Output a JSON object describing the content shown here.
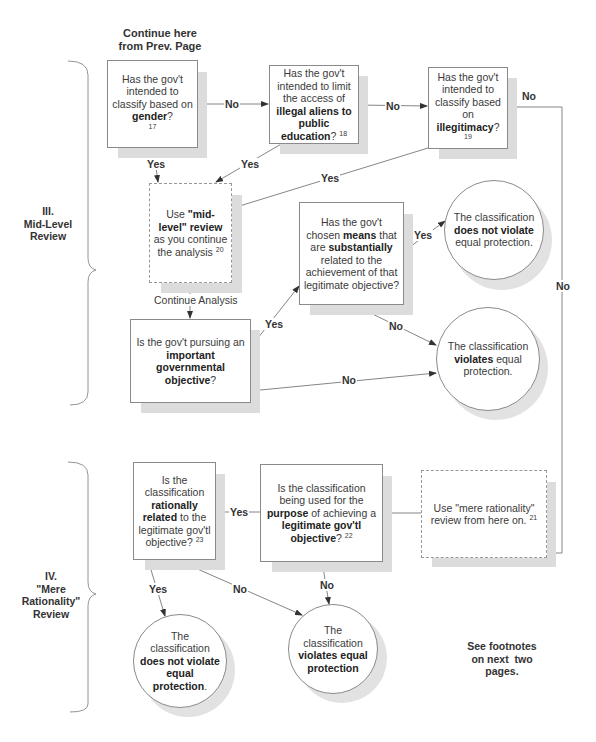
{
  "header": {
    "continue_line1": "Continue here",
    "continue_line2": "from Prev. Page"
  },
  "sections": {
    "mid_level": {
      "line1": "III.",
      "line2": "Mid-Level",
      "line3": "Review"
    },
    "mere_rationality": {
      "line1": "IV.",
      "line2": "\"Mere",
      "line3": "Rationality\"",
      "line4": "Review"
    }
  },
  "nodes": {
    "gender": {
      "pre": "Has the gov't intended to classify based on ",
      "bold": "gender",
      "post": "?",
      "footnote": "17"
    },
    "aliens": {
      "pre": "Has the gov't intended to limit the access of ",
      "bold": "illegal aliens to public education",
      "post": "?",
      "footnote": "18"
    },
    "illegitimacy": {
      "pre": "Has the gov't intended to classify based on ",
      "bold": "illegitimacy",
      "post": "?",
      "footnote": "19"
    },
    "mid_level_review": {
      "pre": "Use ",
      "bold1": "\"mid-level\" review",
      "post": " as you continue the analysis",
      "footnote": "20"
    },
    "important_objective": {
      "pre": "Is the gov't pursuing an ",
      "bold": "important governmental objective",
      "post": "?"
    },
    "substantially_related": {
      "pre": "Has the gov't chosen ",
      "bold1": "means",
      "mid": " that are ",
      "bold2": "substantially",
      "post": " related to the achievement of that legitimate objective?"
    },
    "mere_rationality_review": {
      "text": "Use \"mere rationality\" review from here on.",
      "footnote": "21"
    },
    "legitimate_purpose": {
      "pre": "Is the classification being used for the ",
      "bold1": "purpose",
      "mid": " of achieving a ",
      "bold2": "legitimate gov'tl objective",
      "post": "?",
      "footnote": "22"
    },
    "rationally_related": {
      "pre": "Is the classification ",
      "bold": "rationally related",
      "post": " to the legitimate gov'tl objective?",
      "footnote": "23"
    }
  },
  "outcomes": {
    "mid_not_violate": {
      "pre": "The classification ",
      "bold": "does not violate",
      "post": " equal protection."
    },
    "mid_violates": {
      "pre": "The classification ",
      "bold": "violates",
      "post": " equal protection."
    },
    "rat_not_violate": {
      "pre": "The classification ",
      "bold": "does not violate equal protection",
      "post": "."
    },
    "rat_violates": {
      "pre": "The classification ",
      "bold": "violates equal protection",
      "post": ""
    }
  },
  "edge_labels": {
    "yes": "Yes",
    "no": "No",
    "continue_analysis": "Continue Analysis"
  },
  "footer_note": {
    "line1": "See footnotes",
    "line2": "on next  two",
    "line3": "pages."
  }
}
